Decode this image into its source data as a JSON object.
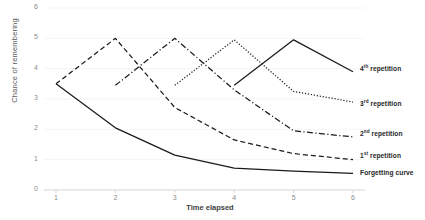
{
  "chart_data": {
    "type": "line",
    "title": "",
    "xlabel": "Time elapsed",
    "ylabel": "Chance of remembering",
    "xlim": [
      0.5,
      6.3
    ],
    "ylim": [
      0,
      6
    ],
    "xticks": [
      1,
      2,
      3,
      4,
      5,
      6
    ],
    "yticks": [
      0,
      1,
      2,
      3,
      4,
      5,
      6
    ],
    "grid": "horizontal",
    "legend_position": "right-inline",
    "series": [
      {
        "name": "Forgetting curve",
        "style": "solid",
        "label": "Forgetting curve",
        "x": [
          1,
          2,
          3,
          4,
          5,
          6
        ],
        "values": [
          3.5,
          2.05,
          1.15,
          0.72,
          0.62,
          0.55
        ]
      },
      {
        "name": "1st repetition",
        "style": "dashed",
        "label": "1",
        "label_sup": "st",
        "label_rest": "repetition",
        "x": [
          1,
          2,
          3,
          4,
          5,
          6
        ],
        "values": [
          3.5,
          5.0,
          2.72,
          1.65,
          1.2,
          1.0
        ]
      },
      {
        "name": "2nd repetition",
        "style": "dash-dot",
        "label": "2",
        "label_sup": "nd",
        "label_rest": "repetition",
        "x": [
          2,
          3,
          4,
          5,
          6
        ],
        "values": [
          3.45,
          5.0,
          3.3,
          1.95,
          1.75
        ]
      },
      {
        "name": "3rd repetition",
        "style": "dotted",
        "label": "3",
        "label_sup": "rd",
        "label_rest": "repetition",
        "x": [
          3,
          4,
          5,
          6
        ],
        "values": [
          3.45,
          4.95,
          3.25,
          2.9
        ]
      },
      {
        "name": "4th repetition",
        "style": "solid",
        "label": "4",
        "label_sup": "th",
        "label_rest": "repetition",
        "x": [
          4,
          5,
          6
        ],
        "values": [
          3.45,
          4.95,
          3.9
        ]
      }
    ]
  },
  "axis": {
    "y_title": "Chance of remembering",
    "x_title": "Time elapsed",
    "y_ticks": [
      "0",
      "1",
      "2",
      "3",
      "4",
      "5",
      "6"
    ],
    "x_ticks": [
      "1",
      "2",
      "3",
      "4",
      "5",
      "6"
    ]
  },
  "legend": {
    "items": [
      {
        "id": "forgetting-curve",
        "text": "Forgetting curve"
      },
      {
        "id": "first-repetition",
        "num": "1",
        "sup": "st",
        "text": "repetition"
      },
      {
        "id": "second-repetition",
        "num": "2",
        "sup": "nd",
        "text": "repetition"
      },
      {
        "id": "third-repetition",
        "num": "3",
        "sup": "rd",
        "text": "repetition"
      },
      {
        "id": "fourth-repetition",
        "num": "4",
        "sup": "th",
        "text": "repetition"
      }
    ]
  },
  "colors": {
    "line": "#1a1a1a",
    "grid": "#f2f2f2",
    "axis": "#d9d9d9",
    "tick_text": "#8c8c8c",
    "legend_text": "#262626"
  }
}
